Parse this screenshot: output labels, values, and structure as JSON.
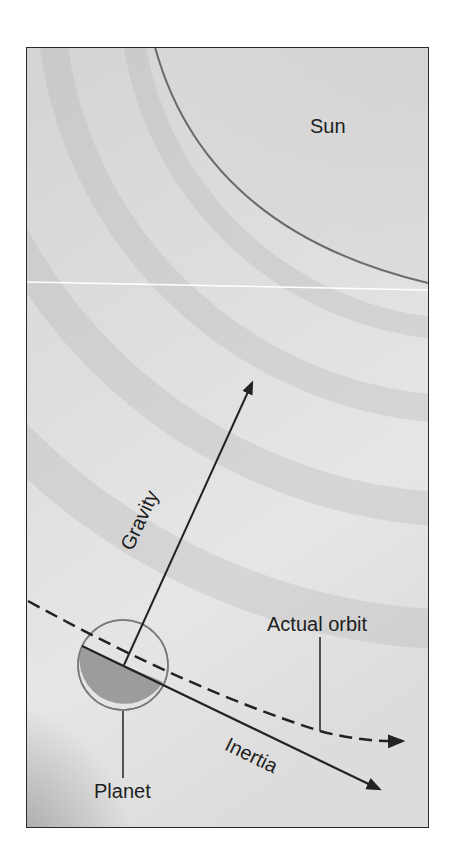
{
  "figure": {
    "labels": {
      "sun": "Sun",
      "gravity": "Gravity",
      "actual_orbit": "Actual orbit",
      "inertia": "Inertia",
      "planet": "Planet"
    },
    "colors": {
      "background_light": "#e4e4e4",
      "background_dark": "#a8a8a8",
      "line": "#222222",
      "sun_edge": "#6a6a6a",
      "planet_light": "#e2e2e2",
      "planet_shadow": "#9a9a9a"
    }
  }
}
